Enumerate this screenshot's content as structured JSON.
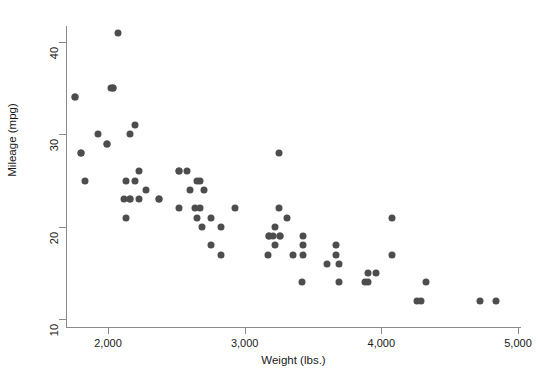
{
  "chart_data": {
    "type": "scatter",
    "title": "",
    "xlabel": "Weight (lbs.)",
    "ylabel": "Mileage (mpg)",
    "xlim": [
      1700,
      5000
    ],
    "ylim": [
      9,
      42
    ],
    "grid": false,
    "legend": null,
    "xticks": [
      2000,
      3000,
      4000,
      5000
    ],
    "xticklabels": [
      "2,000",
      "3,000",
      "4,000",
      "5,000"
    ],
    "yticks": [
      10,
      20,
      30,
      40
    ],
    "yticklabels": [
      "10",
      "20",
      "30",
      "40"
    ],
    "marker": {
      "shape": "circle",
      "color": "#4d4d4d",
      "size": 7
    },
    "x": [
      2930,
      3350,
      2640,
      3250,
      4080,
      3670,
      2230,
      2130,
      4330,
      3900,
      4290,
      3960,
      4260,
      3690,
      3180,
      3220,
      3430,
      3260,
      3600,
      2690,
      2130,
      2650,
      3250,
      4080,
      3670,
      2230,
      2750,
      3170,
      2600,
      2700,
      3690,
      3180,
      3220,
      3430,
      3260,
      2160,
      2040,
      2520,
      1800,
      1760,
      3420,
      3880,
      2370,
      2020,
      2280,
      2750,
      3430,
      3210,
      2070,
      1930,
      1990,
      2160,
      2670,
      2370,
      2830,
      2200,
      2670,
      3310,
      2200,
      2520,
      2830,
      2650,
      1800,
      1760,
      1830,
      2120,
      2160,
      2040,
      1990,
      2520,
      4720,
      4840,
      3900,
      2580
    ],
    "y": [
      22,
      17,
      22,
      22,
      17,
      17,
      23,
      25,
      14,
      15,
      12,
      15,
      12,
      14,
      19,
      18,
      17,
      19,
      16,
      20,
      21,
      25,
      28,
      21,
      18,
      26,
      18,
      17,
      24,
      24,
      16,
      19,
      20,
      18,
      19,
      23,
      35,
      26,
      28,
      34,
      14,
      14,
      23,
      35,
      24,
      21,
      19,
      19,
      41,
      30,
      29,
      30,
      22,
      23,
      17,
      31,
      25,
      21,
      25,
      22,
      20,
      21,
      28,
      34,
      25,
      23,
      23,
      35,
      29,
      26,
      12,
      12,
      14,
      26
    ],
    "n_points": 74,
    "calibration": {
      "x_px_at_2000": 108,
      "x_px_per_unit": 0.13667,
      "y_px_at_40": 42,
      "y_px_per_unit": 9.24
    }
  }
}
